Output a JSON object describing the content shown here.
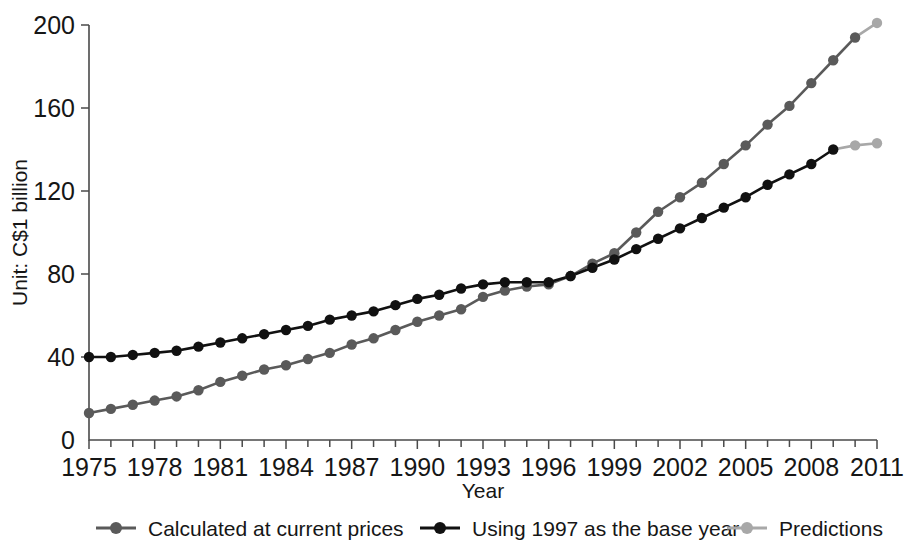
{
  "chart_data": {
    "type": "line",
    "title": "",
    "xlabel": "Year",
    "ylabel": "Unit: C$1 billion",
    "xlim": [
      1975,
      2011
    ],
    "ylim": [
      0,
      200
    ],
    "yticks": [
      0,
      40,
      80,
      120,
      160,
      200
    ],
    "ytick_labels": [
      "0",
      "40",
      "80",
      "120",
      "160",
      "200"
    ],
    "xticks": [
      1975,
      1978,
      1981,
      1984,
      1987,
      1990,
      1993,
      1996,
      1999,
      2002,
      2005,
      2008,
      2011
    ],
    "xtick_labels": [
      "1975",
      "1978",
      "1981",
      "1984",
      "1987",
      "1990",
      "1993",
      "1996",
      "1999",
      "2002",
      "2005",
      "2008",
      "2011"
    ],
    "minor_xticks_every": 1,
    "grid": false,
    "legend_position": "bottom",
    "x": [
      1975,
      1976,
      1977,
      1978,
      1979,
      1980,
      1981,
      1982,
      1983,
      1984,
      1985,
      1986,
      1987,
      1988,
      1989,
      1990,
      1991,
      1992,
      1993,
      1994,
      1995,
      1996,
      1997,
      1998,
      1999,
      2000,
      2001,
      2002,
      2003,
      2004,
      2005,
      2006,
      2007,
      2008,
      2009,
      2010,
      2011
    ],
    "series": [
      {
        "name": "Calculated at current prices",
        "color": "#5a5a5a",
        "marker": "circle",
        "x": [
          1975,
          1976,
          1977,
          1978,
          1979,
          1980,
          1981,
          1982,
          1983,
          1984,
          1985,
          1986,
          1987,
          1988,
          1989,
          1990,
          1991,
          1992,
          1993,
          1994,
          1995,
          1996,
          1997,
          1998,
          1999,
          2000,
          2001,
          2002,
          2003,
          2004,
          2005,
          2006,
          2007,
          2008,
          2009,
          2010
        ],
        "values": [
          13,
          15,
          17,
          19,
          21,
          24,
          28,
          31,
          34,
          36,
          39,
          42,
          46,
          49,
          53,
          57,
          60,
          63,
          69,
          72,
          74,
          75,
          79,
          85,
          90,
          100,
          110,
          117,
          124,
          133,
          142,
          152,
          161,
          172,
          183,
          194
        ]
      },
      {
        "name": "Using 1997 as the base year",
        "color": "#111111",
        "marker": "circle",
        "x": [
          1975,
          1976,
          1977,
          1978,
          1979,
          1980,
          1981,
          1982,
          1983,
          1984,
          1985,
          1986,
          1987,
          1988,
          1989,
          1990,
          1991,
          1992,
          1993,
          1994,
          1995,
          1996,
          1997,
          1998,
          1999,
          2000,
          2001,
          2002,
          2003,
          2004,
          2005,
          2006,
          2007,
          2008,
          2009
        ],
        "values": [
          40,
          40,
          41,
          42,
          43,
          45,
          47,
          49,
          51,
          53,
          55,
          58,
          60,
          62,
          65,
          68,
          70,
          73,
          75,
          76,
          76,
          76,
          79,
          83,
          87,
          92,
          97,
          102,
          107,
          112,
          117,
          123,
          128,
          133,
          140
        ]
      },
      {
        "name": "Predictions",
        "color": "#a8a8a8",
        "marker": "circle",
        "segments": [
          {
            "x": [
              2010,
              2011
            ],
            "values": [
              194,
              201
            ]
          },
          {
            "x": [
              2009,
              2010,
              2011
            ],
            "values": [
              140,
              142,
              143
            ]
          }
        ]
      }
    ]
  },
  "legend": {
    "items": [
      {
        "label": "Calculated at current prices",
        "color": "#5a5a5a"
      },
      {
        "label": "Using 1997 as the base year",
        "color": "#111111"
      },
      {
        "label": "Predictions",
        "color": "#a8a8a8"
      }
    ]
  },
  "axes": {
    "y_axis_title": "Unit: C$1 billion",
    "x_axis_title": "Year"
  }
}
